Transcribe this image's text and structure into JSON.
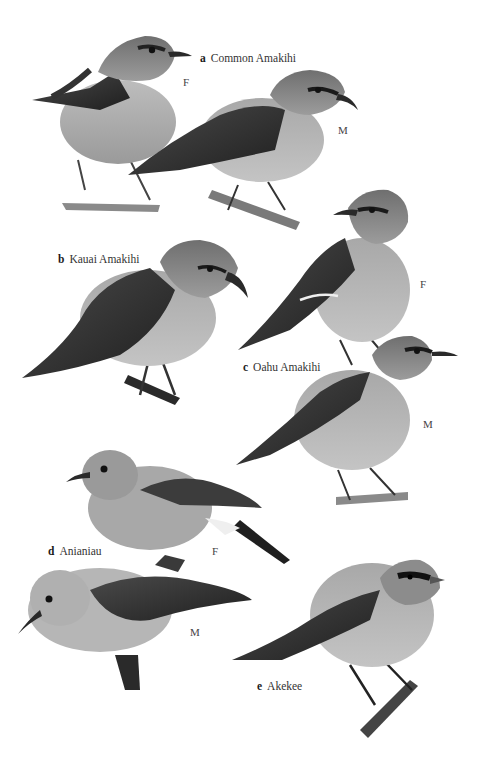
{
  "plate": {
    "background": "#ffffff",
    "species": [
      {
        "letter": "a",
        "name": "Common Amakihi",
        "figures": [
          {
            "sex": "F"
          },
          {
            "sex": "M"
          }
        ]
      },
      {
        "letter": "b",
        "name": "Kauai Amakihi",
        "figures": []
      },
      {
        "letter": "c",
        "name": "Oahu Amakihi",
        "figures": [
          {
            "sex": "F"
          },
          {
            "sex": "M"
          }
        ]
      },
      {
        "letter": "d",
        "name": "Anianiau",
        "figures": [
          {
            "sex": "F"
          },
          {
            "sex": "M"
          }
        ]
      },
      {
        "letter": "e",
        "name": "Akekee",
        "figures": []
      }
    ]
  }
}
